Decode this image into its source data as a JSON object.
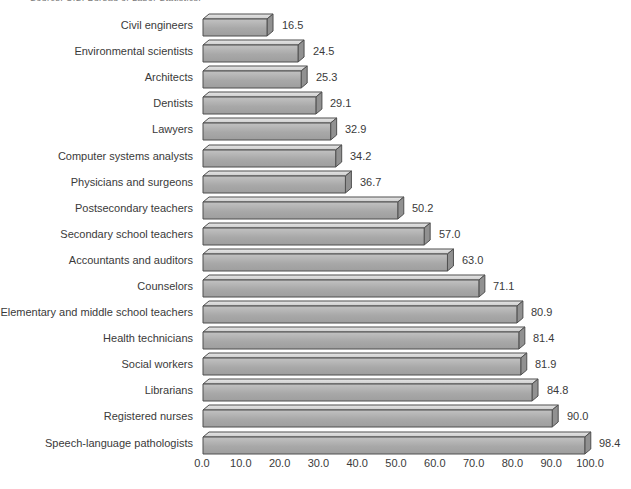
{
  "page": {
    "source_note": "Source: U.S. Bureau of Labor Statistics."
  },
  "chart_data": {
    "type": "bar",
    "orientation": "horizontal",
    "style": "3d-extruded",
    "title": "",
    "xlabel": "",
    "ylabel": "",
    "categories": [
      "Civil engineers",
      "Environmental scientists",
      "Architects",
      "Dentists",
      "Lawyers",
      "Computer systems analysts",
      "Physicians and surgeons",
      "Postsecondary teachers",
      "Secondary school teachers",
      "Accountants and auditors",
      "Counselors",
      "Elementary and middle school teachers",
      "Health technicians",
      "Social workers",
      "Librarians",
      "Registered nurses",
      "Speech-language pathologists"
    ],
    "values": [
      16.5,
      24.5,
      25.3,
      29.1,
      32.9,
      34.2,
      36.7,
      50.2,
      57.0,
      63.0,
      71.1,
      80.9,
      81.4,
      81.9,
      84.8,
      90.0,
      98.4
    ],
    "value_labels": [
      "16.5",
      "24.5",
      "25.3",
      "29.1",
      "32.9",
      "34.2",
      "36.7",
      "50.2",
      "57.0",
      "63.0",
      "71.1",
      "80.9",
      "81.4",
      "81.9",
      "84.8",
      "90.0",
      "98.4"
    ],
    "x_ticks": [
      "0.0",
      "10.0",
      "20.0",
      "30.0",
      "40.0",
      "50.0",
      "60.0",
      "70.0",
      "80.0",
      "90.0",
      "100.0"
    ],
    "x_tick_values": [
      0,
      10,
      20,
      30,
      40,
      50,
      60,
      70,
      80,
      90,
      100
    ],
    "xlim": [
      0,
      100
    ],
    "grid": false,
    "legend": false,
    "colors": {
      "bar_front_light": "#c2c2c2",
      "bar_front_mid": "#a8a8a8",
      "bar_front_dark": "#9e9e9e",
      "bar_top_light": "#e6e6e6",
      "bar_top_dark": "#cccccc",
      "bar_side": "#919191",
      "bar_outline": "#4f4f4f",
      "text": "#3a3a3a"
    }
  }
}
